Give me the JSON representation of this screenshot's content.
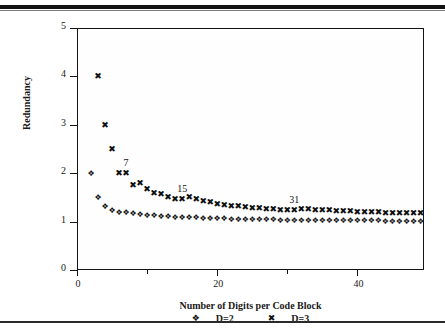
{
  "figure": {
    "ylabel": "Redundancy",
    "xlabel": "Number of Digits per Code Block",
    "legend": [
      {
        "glyph": "❖",
        "label": "D=2",
        "marker_name": "diamond-marker"
      },
      {
        "glyph": "✖",
        "label": "D=3",
        "marker_name": "cross-marker"
      }
    ]
  },
  "chart_data": {
    "type": "scatter",
    "title": "",
    "xlabel": "Number of Digits per Code Block",
    "ylabel": "Redundancy",
    "xlim": [
      0,
      49.5
    ],
    "ylim": [
      0,
      5
    ],
    "xticks": [
      0,
      20,
      40
    ],
    "xticks_minor": [
      10,
      30,
      50
    ],
    "yticks": [
      0,
      1,
      2,
      3,
      4,
      5
    ],
    "grid": false,
    "legend_position": "below-axis",
    "marker_glyphs": {
      "D=2": "❖",
      "D=3": "✖"
    },
    "annotations": [
      {
        "text": "7",
        "x": 7,
        "y": 2.0
      },
      {
        "text": "15",
        "x": 15,
        "y": 1.46
      },
      {
        "text": "31",
        "x": 31,
        "y": 1.25
      }
    ],
    "series": [
      {
        "name": "D=2",
        "marker": "diamond",
        "x": [
          2,
          3,
          4,
          5,
          6,
          7,
          8,
          9,
          10,
          11,
          12,
          13,
          14,
          15,
          16,
          17,
          18,
          19,
          20,
          21,
          22,
          23,
          24,
          25,
          26,
          27,
          28,
          29,
          30,
          31,
          32,
          33,
          34,
          35,
          36,
          37,
          38,
          39,
          40,
          41,
          42,
          43,
          44,
          45,
          46,
          47,
          48,
          49
        ],
        "y": [
          2.0,
          1.5,
          1.33,
          1.25,
          1.2,
          1.19,
          1.17,
          1.16,
          1.14,
          1.13,
          1.12,
          1.11,
          1.1,
          1.1,
          1.09,
          1.09,
          1.08,
          1.08,
          1.07,
          1.07,
          1.06,
          1.06,
          1.06,
          1.05,
          1.05,
          1.05,
          1.05,
          1.04,
          1.04,
          1.04,
          1.04,
          1.04,
          1.04,
          1.03,
          1.03,
          1.03,
          1.03,
          1.03,
          1.03,
          1.03,
          1.03,
          1.03,
          1.02,
          1.02,
          1.02,
          1.02,
          1.02,
          1.02
        ]
      },
      {
        "name": "D=3",
        "marker": "cross",
        "x": [
          3,
          4,
          5,
          6,
          7,
          8,
          9,
          10,
          11,
          12,
          13,
          14,
          15,
          16,
          17,
          18,
          19,
          20,
          21,
          22,
          23,
          24,
          25,
          26,
          27,
          28,
          29,
          30,
          31,
          32,
          33,
          34,
          35,
          36,
          37,
          38,
          39,
          40,
          41,
          42,
          43,
          44,
          45,
          46,
          47,
          48,
          49
        ],
        "y": [
          4.0,
          3.0,
          2.5,
          2.0,
          2.0,
          1.75,
          1.8,
          1.67,
          1.6,
          1.57,
          1.5,
          1.47,
          1.46,
          1.5,
          1.46,
          1.42,
          1.4,
          1.37,
          1.35,
          1.33,
          1.32,
          1.3,
          1.29,
          1.28,
          1.27,
          1.26,
          1.25,
          1.25,
          1.25,
          1.27,
          1.26,
          1.25,
          1.24,
          1.23,
          1.22,
          1.21,
          1.21,
          1.2,
          1.2,
          1.19,
          1.19,
          1.18,
          1.18,
          1.18,
          1.17,
          1.17,
          1.17
        ]
      }
    ]
  }
}
